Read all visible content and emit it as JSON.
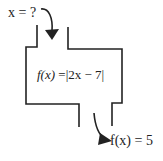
{
  "diagram": {
    "type": "function-machine",
    "input_label": "x = ?",
    "function": {
      "name": "f(x)",
      "equals": " =",
      "expression": "|2x − 7|"
    },
    "output_label": "f(x) = 5",
    "colors": {
      "stroke": "#222222",
      "background": "#ffffff"
    }
  }
}
